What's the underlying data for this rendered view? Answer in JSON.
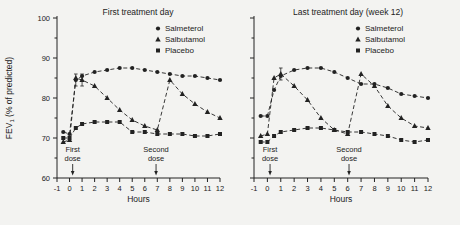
{
  "figure": {
    "background": "#f3f3f1",
    "ink": "#222222",
    "ylabel": "FEV1 (% of predicted)",
    "ylabel_main": "FEV",
    "ylabel_sub": "1",
    "ylabel_rest": " (% of predicted)"
  },
  "chart_data": [
    {
      "type": "line",
      "title": "First treatment day",
      "xlabel": "Hours",
      "ylabel": "FEV1 (% of predicted)",
      "xlim": [
        -1,
        12
      ],
      "ylim": [
        60,
        100
      ],
      "x_ticks": [
        -1,
        0,
        1,
        2,
        3,
        4,
        5,
        6,
        7,
        8,
        9,
        10,
        11,
        12
      ],
      "y_ticks": [
        60,
        70,
        80,
        90,
        100
      ],
      "y_minor_ticks": [
        65,
        75,
        85,
        95
      ],
      "show_y_labels": true,
      "legend_position": "upper-right",
      "grid": false,
      "line_style": "dashed",
      "annotations": [
        {
          "text_line1": "First",
          "text_line2": "dose",
          "x": 0.25
        },
        {
          "text_line1": "Second",
          "text_line2": "dose",
          "x": 6.9
        }
      ],
      "series": [
        {
          "name": "Salmeterol",
          "marker": "circle",
          "x": [
            -0.5,
            0,
            0.5,
            1,
            2,
            3,
            4,
            5,
            6,
            7,
            8,
            9,
            10,
            11,
            12
          ],
          "y": [
            71.5,
            71,
            84.5,
            85.5,
            86.5,
            87,
            87.5,
            87.5,
            87,
            86.5,
            86,
            85.5,
            85.5,
            85,
            84.5
          ]
        },
        {
          "name": "Salbutamol",
          "marker": "triangle",
          "x": [
            -0.5,
            0,
            0.5,
            1,
            2,
            3,
            4,
            5,
            6,
            7,
            8,
            9,
            10,
            11,
            12
          ],
          "y": [
            69,
            69.5,
            85,
            84.5,
            83,
            80,
            77,
            74.5,
            73,
            72,
            84.5,
            81,
            78.5,
            76.5,
            75
          ]
        },
        {
          "name": "Placebo",
          "marker": "square",
          "x": [
            -0.5,
            0,
            0.5,
            1,
            2,
            3,
            4,
            5,
            6,
            7,
            8,
            9,
            10,
            11,
            12
          ],
          "y": [
            70,
            70,
            72.5,
            73.5,
            74,
            74,
            74,
            71.5,
            71.5,
            71,
            71,
            71,
            70.5,
            70.5,
            71
          ]
        }
      ],
      "error_bars": [
        {
          "series": 0,
          "index": 2,
          "delta": 1.5
        },
        {
          "series": 1,
          "index": 3,
          "delta": 1.5
        }
      ]
    },
    {
      "type": "line",
      "title": "Last treatment day (week 12)",
      "xlabel": "Hours",
      "ylabel": "",
      "xlim": [
        -1,
        12
      ],
      "ylim": [
        60,
        100
      ],
      "x_ticks": [
        -1,
        0,
        1,
        2,
        3,
        4,
        5,
        6,
        7,
        8,
        9,
        10,
        11,
        12
      ],
      "y_ticks": [
        60,
        70,
        80,
        90,
        100
      ],
      "y_minor_ticks": [
        65,
        75,
        85,
        95
      ],
      "show_y_labels": false,
      "legend_position": "upper-right",
      "grid": false,
      "line_style": "dashed",
      "annotations": [
        {
          "text_line1": "First",
          "text_line2": "dose",
          "x": 0.2
        },
        {
          "text_line1": "Second",
          "text_line2": "dose",
          "x": 6.1
        }
      ],
      "series": [
        {
          "name": "Salmeterol",
          "marker": "circle",
          "x": [
            -0.5,
            0,
            0.5,
            1,
            2,
            3,
            4,
            5,
            6,
            7,
            8,
            9,
            10,
            11,
            12
          ],
          "y": [
            75.5,
            75.5,
            82,
            85.5,
            87,
            87.5,
            87.5,
            86.5,
            85,
            83.5,
            83.5,
            82.5,
            81,
            80.5,
            80
          ]
        },
        {
          "name": "Salbutamol",
          "marker": "triangle",
          "x": [
            -0.5,
            0,
            0.5,
            1,
            2,
            3,
            4,
            5,
            6,
            7,
            8,
            9,
            10,
            11,
            12
          ],
          "y": [
            70.5,
            71,
            85,
            86,
            83,
            79.5,
            75,
            72,
            71,
            86,
            83,
            78,
            75,
            73,
            72.5
          ]
        },
        {
          "name": "Placebo",
          "marker": "square",
          "x": [
            -0.5,
            0,
            0.5,
            1,
            2,
            3,
            4,
            5,
            6,
            7,
            8,
            9,
            10,
            11,
            12
          ],
          "y": [
            69,
            69,
            70.5,
            71.5,
            72,
            72.5,
            72.5,
            72,
            71.5,
            71.5,
            71,
            70.5,
            69.5,
            69,
            69.5
          ]
        }
      ],
      "error_bars": [
        {
          "series": 1,
          "index": 3,
          "delta": 1.5
        }
      ]
    }
  ]
}
